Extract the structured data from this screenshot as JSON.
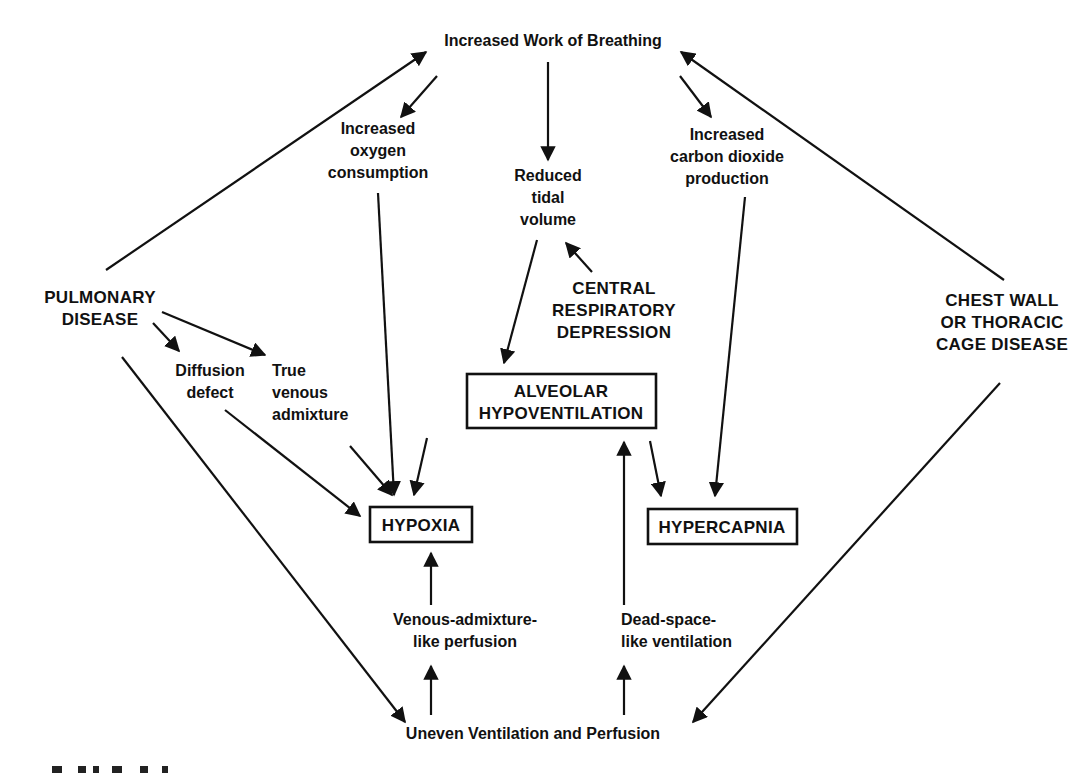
{
  "diagram": {
    "title": "Increased Work of Breathing",
    "colors": {
      "ink": "#111111",
      "background": "#ffffff"
    },
    "nodes": {
      "work": {
        "lines": [
          "Increased Work of Breathing"
        ],
        "boxed": false
      },
      "o2": {
        "lines": [
          "Increased",
          "oxygen",
          "consumption"
        ],
        "boxed": false
      },
      "tidal": {
        "lines": [
          "Reduced",
          "tidal",
          "volume"
        ],
        "boxed": false
      },
      "co2": {
        "lines": [
          "Increased",
          "carbon dioxide",
          "production"
        ],
        "boxed": false
      },
      "pulm": {
        "lines": [
          "PULMONARY",
          "DISEASE"
        ],
        "boxed": false
      },
      "central": {
        "lines": [
          "CENTRAL",
          "RESPIRATORY",
          "DEPRESSION"
        ],
        "boxed": false
      },
      "chest": {
        "lines": [
          "CHEST WALL",
          "OR THORACIC",
          "CAGE DISEASE"
        ],
        "boxed": false
      },
      "diffusion": {
        "lines": [
          "Diffusion",
          "defect"
        ],
        "boxed": false
      },
      "venous": {
        "lines": [
          "True",
          "venous",
          "admixture"
        ],
        "boxed": false
      },
      "alveolar": {
        "lines": [
          "ALVEOLAR",
          "HYPOVENTILATION"
        ],
        "boxed": true
      },
      "hypoxia": {
        "lines": [
          "HYPOXIA"
        ],
        "boxed": true
      },
      "hypercapnia": {
        "lines": [
          "HYPERCAPNIA"
        ],
        "boxed": true
      },
      "venlike": {
        "lines": [
          "Venous-admixture-",
          "like perfusion"
        ],
        "boxed": false
      },
      "deadspace": {
        "lines": [
          "Dead-space-",
          "like ventilation"
        ],
        "boxed": false
      },
      "uneven": {
        "lines": [
          "Uneven Ventilation and Perfusion"
        ],
        "boxed": false
      }
    },
    "edges": [
      {
        "from": "pulm",
        "to": "work"
      },
      {
        "from": "chest",
        "to": "work"
      },
      {
        "from": "work",
        "to": "o2"
      },
      {
        "from": "work",
        "to": "tidal"
      },
      {
        "from": "work",
        "to": "co2"
      },
      {
        "from": "central",
        "to": "tidal"
      },
      {
        "from": "tidal",
        "to": "alveolar"
      },
      {
        "from": "pulm",
        "to": "diffusion"
      },
      {
        "from": "pulm",
        "to": "venous"
      },
      {
        "from": "diffusion",
        "to": "hypoxia"
      },
      {
        "from": "venous",
        "to": "hypoxia"
      },
      {
        "from": "o2",
        "to": "hypoxia"
      },
      {
        "from": "alveolar",
        "to": "hypoxia"
      },
      {
        "from": "alveolar",
        "to": "hypercapnia"
      },
      {
        "from": "co2",
        "to": "hypercapnia"
      },
      {
        "from": "venlike",
        "to": "hypoxia"
      },
      {
        "from": "deadspace",
        "to": "alveolar"
      },
      {
        "from": "uneven",
        "to": "venlike"
      },
      {
        "from": "uneven",
        "to": "deadspace"
      },
      {
        "from": "pulm",
        "to": "uneven"
      },
      {
        "from": "chest",
        "to": "uneven"
      }
    ]
  }
}
